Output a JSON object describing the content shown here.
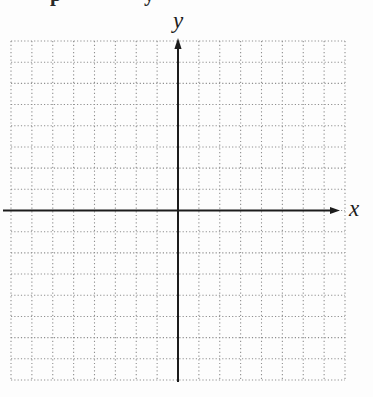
{
  "figure": {
    "x_axis_label": "x",
    "y_axis_label": "y",
    "top_text_fragments": [
      "p",
      "y"
    ]
  },
  "chart_data": {
    "type": "scatter",
    "title": "",
    "xlabel": "x",
    "ylabel": "y",
    "xlim": [
      -8,
      8
    ],
    "ylim": [
      -8,
      8
    ],
    "grid": true,
    "grid_step": 1,
    "series": []
  },
  "colors": {
    "background": "#fdfdfd",
    "grid_dots": "#8f8f8f",
    "axis": "#1c1c1c",
    "label": "#1c1c1c"
  }
}
